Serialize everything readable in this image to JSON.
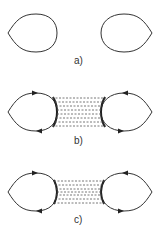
{
  "panels": [
    {
      "id": "a",
      "label": "a)",
      "dashed_lines": 0
    },
    {
      "id": "b",
      "label": "b)",
      "dashed_lines": 8
    },
    {
      "id": "c",
      "label": "c)",
      "dashed_lines": 7
    }
  ],
  "colors": {
    "stroke": "#333333",
    "dashed": "#555555"
  }
}
